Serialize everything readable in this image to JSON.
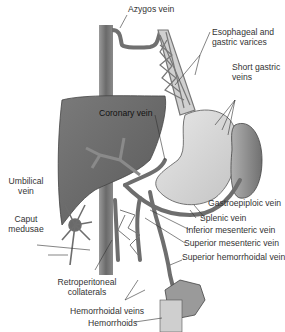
{
  "diagram": {
    "colors": {
      "vein": "#6e6e6e",
      "liver": "#6a6a6a",
      "stomach": "#d9d9d9",
      "spleen": "#8a8a8a",
      "label_text": "#333333",
      "leader_line": "#333333"
    },
    "labels": {
      "azygos": "Azygos vein",
      "esophageal_1": "Esophageal and",
      "esophageal_2": "gastric varices",
      "short_gastric_1": "Short gastric",
      "short_gastric_2": "veins",
      "coronary": "Coronary vein",
      "umbilical_1": "Umbilical",
      "umbilical_2": "vein",
      "gastroepiploic": "Gastroepiploic vein",
      "caput_1": "Caput",
      "caput_2": "medusae",
      "splenic": "Splenic vein",
      "inferior_mesenteric": "Inferior mesenteric vein",
      "superior_mesenteric": "Superior mesenteric vein",
      "superior_hemorrhoidal": "Superior hemorrhoidal vein",
      "retro_1": "Retroperitoneal",
      "retro_2": "collaterals",
      "hemorrhoidal_veins": "Hemorrhoidal veins",
      "hemorrhoids": "Hemorrhoids"
    }
  }
}
